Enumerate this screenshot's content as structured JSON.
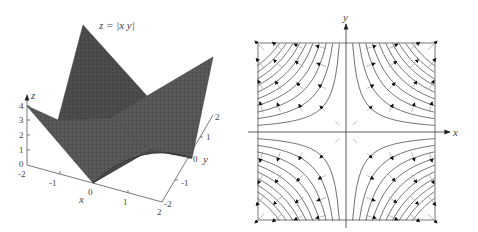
{
  "left_panel": {
    "title": "z = |x y|",
    "z_axis": {
      "label": "z",
      "ticks": [
        "0",
        "1",
        "2",
        "3",
        "4"
      ]
    },
    "x_axis": {
      "label": "x",
      "ticks": [
        "-2",
        "-1",
        "0",
        "1",
        "2"
      ]
    },
    "y_axis": {
      "label": "y",
      "ticks": [
        "-2",
        "-1",
        "0",
        "1",
        "2"
      ]
    },
    "surface_color": "#555555"
  },
  "right_panel": {
    "x_label": "x",
    "y_label": "y",
    "description": "Level curves xy = c with gradient vectors",
    "curve_color": "#333333",
    "arrow_color": "#111111"
  },
  "chart_data": [
    {
      "type": "surface",
      "title": "z = |x y|",
      "xlabel": "x",
      "ylabel": "y",
      "zlabel": "z",
      "xlim": [
        -2,
        2
      ],
      "ylim": [
        -2,
        2
      ],
      "zlim": [
        0,
        4
      ],
      "x_ticks": [
        -2,
        -1,
        0,
        1,
        2
      ],
      "y_ticks": [
        -2,
        -1,
        0,
        1,
        2
      ],
      "z_ticks": [
        0,
        1,
        2,
        3,
        4
      ],
      "function": "z = |x*y|"
    },
    {
      "type": "contour",
      "xlabel": "x",
      "ylabel": "y",
      "function": "level curves of |xy| with gradient field",
      "grid": false
    }
  ]
}
